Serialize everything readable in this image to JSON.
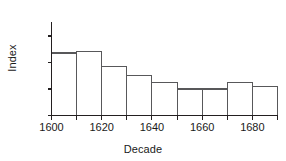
{
  "chart_data": {
    "type": "bar",
    "title": "",
    "xlabel": "Decade",
    "ylabel": "Index",
    "categories": [
      1600,
      1610,
      1620,
      1630,
      1640,
      1650,
      1660,
      1670,
      1680
    ],
    "values": [
      134,
      135,
      121,
      113,
      106,
      100,
      100,
      106,
      102
    ],
    "xlim": [
      1600,
      1690
    ],
    "ylim": [
      75,
      158
    ],
    "xticks": [
      1600,
      1610,
      1620,
      1630,
      1640,
      1650,
      1660,
      1670,
      1680,
      1690
    ],
    "xtick_labels": [
      "1600",
      "",
      "1620",
      "",
      "1640",
      "",
      "1660",
      "",
      "1680",
      ""
    ],
    "yticks": [
      75,
      100,
      125,
      150
    ],
    "ytick_labels": [
      "75",
      "100",
      "125",
      "150"
    ],
    "grid": false,
    "legend": false,
    "bar_fill_color": "#ffffff",
    "bar_edge_color": "#58585a",
    "axis_color": "#231f20"
  }
}
